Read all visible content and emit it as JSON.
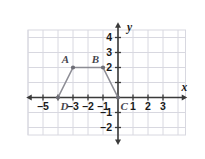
{
  "chart_data": {
    "type": "scatter",
    "title": "",
    "xlabel": "x",
    "ylabel": "y",
    "xlim": [
      -5.8,
      4.5
    ],
    "ylim": [
      -2.7,
      4.8
    ],
    "grid": true,
    "legend": null,
    "x_ticks": [
      -5,
      -4,
      -3,
      -2,
      -1,
      1,
      2,
      3
    ],
    "x_tick_labels": [
      "–5",
      "",
      "–3",
      "–2",
      "–1",
      "1",
      "2",
      "3"
    ],
    "y_ticks": [
      -2,
      -1,
      1,
      2,
      3,
      4
    ],
    "y_tick_labels": [
      "–2",
      "–1",
      "",
      "2",
      "3",
      "4"
    ],
    "series": [
      {
        "name": "trapezoid ABCD",
        "type": "polyline",
        "closed": false,
        "points": [
          {
            "label": "D",
            "x": -4,
            "y": 0
          },
          {
            "label": "A",
            "x": -3,
            "y": 2
          },
          {
            "label": "B",
            "x": -1,
            "y": 2
          },
          {
            "label": "C",
            "x": 0,
            "y": 0
          }
        ]
      }
    ],
    "point_labels": [
      {
        "label": "A",
        "x": -3,
        "y": 2,
        "anchor": "above-left"
      },
      {
        "label": "B",
        "x": -1,
        "y": 2,
        "anchor": "above-left"
      },
      {
        "label": "C",
        "x": 0,
        "y": 0,
        "anchor": "below-left"
      },
      {
        "label": "D",
        "x": -4,
        "y": 0,
        "anchor": "below-right"
      }
    ],
    "colors": {
      "grid": "#d8d8e0",
      "axis": "#3a3a3a",
      "shape_stroke": "#8c8c94",
      "point_fill": "#6e6e76",
      "tick_label": "#1a1a1a"
    }
  },
  "axis_labels": {
    "x": "x",
    "y": "y"
  }
}
